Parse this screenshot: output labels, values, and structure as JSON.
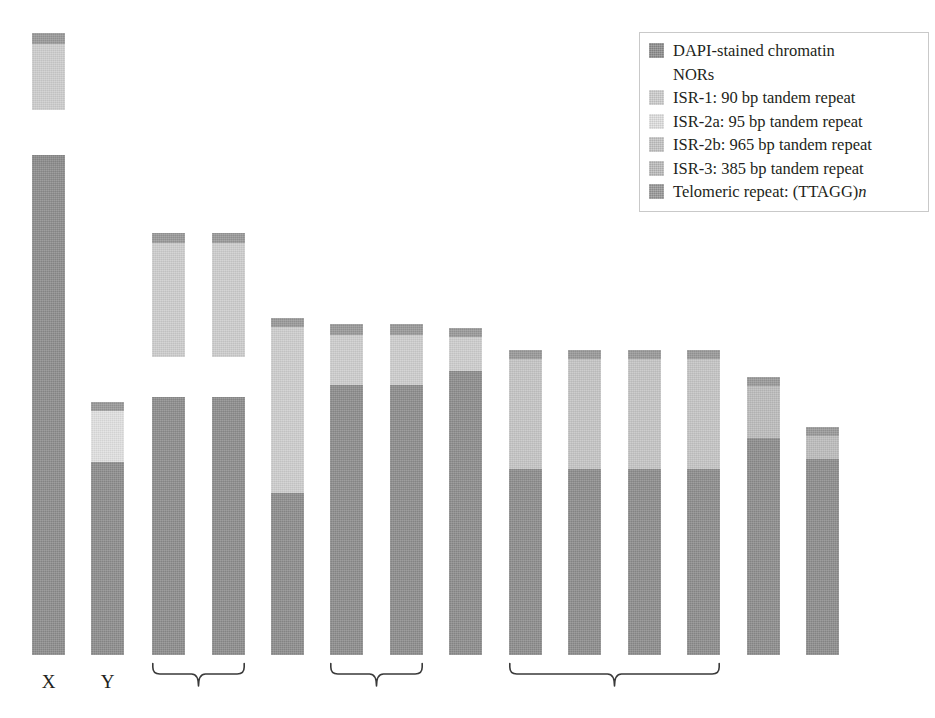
{
  "figure": {
    "type": "idiogram",
    "width": 935,
    "height": 718,
    "background": "#ffffff"
  },
  "palette": {
    "dapi": "#8e8e8e",
    "nor": "#ffffff",
    "isr1": "#cfcfcf",
    "isr2a": "#e2e2e2",
    "isr2b": "#c6c6c6",
    "isr3": "#bdbdbd",
    "telomere": "#9a9a9a",
    "telomere_dark": "#8b8b8b",
    "label": "#231f20",
    "legend_border": "#c9c9c9"
  },
  "legend": {
    "title": "",
    "border_color": "#c9c9c9",
    "items": [
      {
        "label": "DAPI-stained chromatin",
        "color": "#8e8e8e",
        "swatch": "filled",
        "icon": "legend-swatch-dapi"
      },
      {
        "label": "NORs",
        "color": "#ffffff",
        "swatch": "blank",
        "icon": "legend-swatch-nor"
      },
      {
        "label": "ISR-1: 90 bp tandem repeat",
        "color": "#cfcfcf",
        "swatch": "filled",
        "icon": "legend-swatch-isr1"
      },
      {
        "label": "ISR-2a: 95 bp tandem repeat",
        "color": "#e2e2e2",
        "swatch": "filled",
        "icon": "legend-swatch-isr2a"
      },
      {
        "label": "ISR-2b: 965 bp tandem repeat",
        "color": "#c6c6c6",
        "swatch": "filled",
        "icon": "legend-swatch-isr2b"
      },
      {
        "label": "ISR-3: 385 bp tandem repeat",
        "color": "#bdbdbd",
        "swatch": "filled",
        "icon": "legend-swatch-isr3"
      },
      {
        "label_pre": "Telomeric repeat: (TTAGG)",
        "label_italic": "n",
        "color": "#9a9a9a",
        "swatch": "filled",
        "icon": "legend-swatch-telomere"
      }
    ]
  },
  "chart_data": {
    "type": "bar",
    "title": "",
    "xlabel": "",
    "ylabel": "",
    "categories": [
      "X",
      "Y",
      "3",
      "4",
      "5",
      "6",
      "7",
      "8",
      "9",
      "10",
      "11",
      "12",
      "13",
      "14"
    ],
    "note": "Bar = chromosome; y axis is chromosome length in pixels measured from the common baseline at y=655.",
    "values": [
      500,
      253,
      258,
      258,
      337,
      331,
      331,
      327,
      305,
      305,
      305,
      305,
      278,
      228
    ],
    "ylim": [
      0,
      520
    ],
    "grid": false,
    "legend_position": "top-right",
    "chromosomes": [
      {
        "name": "X",
        "label": "X",
        "x": 32,
        "width": 33,
        "baseline": 655,
        "detached_top": {
          "top": 33,
          "bottom": 110,
          "segments": [
            {
              "type": "telomere",
              "color": "#9a9a9a",
              "from_top": 0,
              "height": 11
            },
            {
              "type": "isr1",
              "color": "#cfcfcf",
              "from_top": 11,
              "height": 66
            }
          ]
        },
        "body": {
          "top": 155,
          "bottom": 655,
          "segments": [
            {
              "type": "telomere",
              "color": "#8b8b8b",
              "from_top": 0,
              "height": 10
            },
            {
              "type": "dapi",
              "color": "#8e8e8e",
              "from_top": 10,
              "height": 490
            }
          ]
        }
      },
      {
        "name": "Y",
        "label": "Y",
        "x": 91,
        "width": 33,
        "baseline": 655,
        "body": {
          "top": 402,
          "bottom": 655,
          "segments": [
            {
              "type": "telomere",
              "color": "#9a9a9a",
              "from_top": 0,
              "height": 9
            },
            {
              "type": "isr2a",
              "color": "#e2e2e2",
              "from_top": 9,
              "height": 51
            },
            {
              "type": "dapi",
              "color": "#8e8e8e",
              "from_top": 60,
              "height": 193
            }
          ]
        }
      },
      {
        "name": "3",
        "label": "",
        "x": 152,
        "width": 33,
        "baseline": 655,
        "detached_top": {
          "top": 233,
          "bottom": 357,
          "segments": [
            {
              "type": "telomere",
              "color": "#9a9a9a",
              "from_top": 0,
              "height": 10
            },
            {
              "type": "isr1",
              "color": "#cfcfcf",
              "from_top": 10,
              "height": 114
            }
          ]
        },
        "body": {
          "top": 397,
          "bottom": 655,
          "segments": [
            {
              "type": "dapi",
              "color": "#8e8e8e",
              "from_top": 0,
              "height": 258
            }
          ]
        }
      },
      {
        "name": "4",
        "label": "",
        "x": 212,
        "width": 33,
        "baseline": 655,
        "detached_top": {
          "top": 233,
          "bottom": 357,
          "segments": [
            {
              "type": "telomere",
              "color": "#9a9a9a",
              "from_top": 0,
              "height": 10
            },
            {
              "type": "isr1",
              "color": "#cfcfcf",
              "from_top": 10,
              "height": 114
            }
          ]
        },
        "body": {
          "top": 397,
          "bottom": 655,
          "segments": [
            {
              "type": "dapi",
              "color": "#8e8e8e",
              "from_top": 0,
              "height": 258
            }
          ]
        }
      },
      {
        "name": "5",
        "label": "",
        "x": 271,
        "width": 33,
        "baseline": 655,
        "body": {
          "top": 318,
          "bottom": 655,
          "segments": [
            {
              "type": "telomere",
              "color": "#9a9a9a",
              "from_top": 0,
              "height": 9
            },
            {
              "type": "isr1",
              "color": "#cfcfcf",
              "from_top": 9,
              "height": 166
            },
            {
              "type": "dapi",
              "color": "#8e8e8e",
              "from_top": 175,
              "height": 162
            }
          ]
        }
      },
      {
        "name": "6",
        "label": "",
        "x": 330,
        "width": 33,
        "baseline": 655,
        "body": {
          "top": 324,
          "bottom": 655,
          "segments": [
            {
              "type": "telomere",
              "color": "#9a9a9a",
              "from_top": 0,
              "height": 11
            },
            {
              "type": "isr1",
              "color": "#cfcfcf",
              "from_top": 11,
              "height": 50
            },
            {
              "type": "dapi",
              "color": "#8e8e8e",
              "from_top": 61,
              "height": 270
            }
          ]
        }
      },
      {
        "name": "7",
        "label": "",
        "x": 390,
        "width": 33,
        "baseline": 655,
        "body": {
          "top": 324,
          "bottom": 655,
          "segments": [
            {
              "type": "telomere",
              "color": "#9a9a9a",
              "from_top": 0,
              "height": 11
            },
            {
              "type": "isr1",
              "color": "#cfcfcf",
              "from_top": 11,
              "height": 50
            },
            {
              "type": "dapi",
              "color": "#8e8e8e",
              "from_top": 61,
              "height": 270
            }
          ]
        }
      },
      {
        "name": "8",
        "label": "",
        "x": 449,
        "width": 33,
        "baseline": 655,
        "body": {
          "top": 328,
          "bottom": 655,
          "segments": [
            {
              "type": "telomere",
              "color": "#9a9a9a",
              "from_top": 0,
              "height": 9
            },
            {
              "type": "isr1",
              "color": "#cfcfcf",
              "from_top": 9,
              "height": 34
            },
            {
              "type": "dapi",
              "color": "#8e8e8e",
              "from_top": 43,
              "height": 284
            }
          ]
        }
      },
      {
        "name": "9",
        "label": "",
        "x": 509,
        "width": 33,
        "baseline": 655,
        "body": {
          "top": 350,
          "bottom": 655,
          "segments": [
            {
              "type": "telomere",
              "color": "#9a9a9a",
              "from_top": 0,
              "height": 9
            },
            {
              "type": "isr2b",
              "color": "#c6c6c6",
              "from_top": 9,
              "height": 110
            },
            {
              "type": "dapi",
              "color": "#8e8e8e",
              "from_top": 119,
              "height": 186
            }
          ]
        }
      },
      {
        "name": "10",
        "label": "",
        "x": 568,
        "width": 33,
        "baseline": 655,
        "body": {
          "top": 350,
          "bottom": 655,
          "segments": [
            {
              "type": "telomere",
              "color": "#9a9a9a",
              "from_top": 0,
              "height": 9
            },
            {
              "type": "isr2b",
              "color": "#c6c6c6",
              "from_top": 9,
              "height": 110
            },
            {
              "type": "dapi",
              "color": "#8e8e8e",
              "from_top": 119,
              "height": 186
            }
          ]
        }
      },
      {
        "name": "11",
        "label": "",
        "x": 628,
        "width": 33,
        "baseline": 655,
        "body": {
          "top": 350,
          "bottom": 655,
          "segments": [
            {
              "type": "telomere",
              "color": "#9a9a9a",
              "from_top": 0,
              "height": 9
            },
            {
              "type": "isr2b",
              "color": "#c6c6c6",
              "from_top": 9,
              "height": 110
            },
            {
              "type": "dapi",
              "color": "#8e8e8e",
              "from_top": 119,
              "height": 186
            }
          ]
        }
      },
      {
        "name": "12",
        "label": "",
        "x": 687,
        "width": 33,
        "baseline": 655,
        "body": {
          "top": 350,
          "bottom": 655,
          "segments": [
            {
              "type": "telomere",
              "color": "#9a9a9a",
              "from_top": 0,
              "height": 9
            },
            {
              "type": "isr2b",
              "color": "#c6c6c6",
              "from_top": 9,
              "height": 110
            },
            {
              "type": "dapi",
              "color": "#8e8e8e",
              "from_top": 119,
              "height": 186
            }
          ]
        }
      },
      {
        "name": "13",
        "label": "",
        "x": 747,
        "width": 33,
        "baseline": 655,
        "body": {
          "top": 377,
          "bottom": 655,
          "segments": [
            {
              "type": "telomere",
              "color": "#9a9a9a",
              "from_top": 0,
              "height": 9
            },
            {
              "type": "isr3",
              "color": "#bdbdbd",
              "from_top": 9,
              "height": 52
            },
            {
              "type": "dapi",
              "color": "#8e8e8e",
              "from_top": 61,
              "height": 217
            }
          ]
        }
      },
      {
        "name": "14",
        "label": "",
        "x": 806,
        "width": 33,
        "baseline": 655,
        "body": {
          "top": 427,
          "bottom": 655,
          "segments": [
            {
              "type": "telomere",
              "color": "#9a9a9a",
              "from_top": 0,
              "height": 9
            },
            {
              "type": "isr3",
              "color": "#bdbdbd",
              "from_top": 9,
              "height": 23
            },
            {
              "type": "dapi",
              "color": "#8e8e8e",
              "from_top": 32,
              "height": 196
            }
          ]
        }
      }
    ],
    "brackets": [
      {
        "name": "bracket-pair-3-4",
        "left": 152,
        "right": 245,
        "top": 662,
        "groups": "3-4"
      },
      {
        "name": "bracket-pair-6-7",
        "left": 330,
        "right": 423,
        "top": 662,
        "groups": "6-7"
      },
      {
        "name": "bracket-group-9-12",
        "left": 509,
        "right": 720,
        "top": 662,
        "groups": "9-12"
      }
    ],
    "axis_labels": [
      {
        "text": "X",
        "x": 32,
        "width": 33,
        "y": 672
      },
      {
        "text": "Y",
        "x": 91,
        "width": 33,
        "y": 672
      }
    ]
  }
}
